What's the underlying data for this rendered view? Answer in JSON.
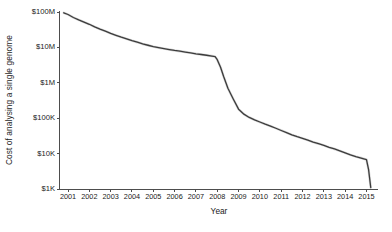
{
  "chart_data": {
    "type": "line",
    "title": "",
    "xlabel": "Year",
    "ylabel": "Cost of analysing a single genome",
    "yscale": "log",
    "ylim": [
      1000,
      100000000
    ],
    "xlim": [
      2000.6,
      2015.4
    ],
    "grid": false,
    "legend": null,
    "line_color": "#3c3c3c",
    "axis_color": "#4d4d4d",
    "ytick_labels": [
      "$100M",
      "$10M",
      "$1M",
      "$100K",
      "$10K",
      "$1K"
    ],
    "ytick_values": [
      100000000,
      10000000,
      1000000,
      100000,
      10000,
      1000
    ],
    "xtick_labels": [
      "2001",
      "2002",
      "2003",
      "2004",
      "2005",
      "2006",
      "2007",
      "2008",
      "2009",
      "2010",
      "2011",
      "2012",
      "2013",
      "2014",
      "2015"
    ],
    "xtick_values": [
      2001,
      2002,
      2003,
      2004,
      2005,
      2006,
      2007,
      2008,
      2009,
      2010,
      2011,
      2012,
      2013,
      2014,
      2015
    ],
    "series": [
      {
        "name": "Cost per genome",
        "x": [
          2000.8,
          2001.0,
          2001.25,
          2001.5,
          2001.75,
          2002.0,
          2002.25,
          2002.5,
          2002.75,
          2003.0,
          2003.25,
          2003.5,
          2003.75,
          2004.0,
          2004.25,
          2004.5,
          2004.75,
          2005.0,
          2005.25,
          2005.5,
          2005.75,
          2006.0,
          2006.25,
          2006.5,
          2006.75,
          2007.0,
          2007.25,
          2007.5,
          2007.75,
          2007.9,
          2008.0,
          2008.15,
          2008.3,
          2008.5,
          2008.75,
          2009.0,
          2009.25,
          2009.5,
          2009.75,
          2010.0,
          2010.25,
          2010.5,
          2010.75,
          2011.0,
          2011.25,
          2011.5,
          2011.75,
          2012.0,
          2012.25,
          2012.5,
          2012.75,
          2013.0,
          2013.25,
          2013.5,
          2013.75,
          2014.0,
          2014.25,
          2014.5,
          2014.75,
          2015.0,
          2015.1,
          2015.2
        ],
        "y": [
          95000000,
          85000000,
          70000000,
          60000000,
          52000000,
          45000000,
          38000000,
          33000000,
          29000000,
          25000000,
          22000000,
          19500000,
          17500000,
          15500000,
          14000000,
          12500000,
          11500000,
          10500000,
          9800000,
          9200000,
          8700000,
          8200000,
          7800000,
          7400000,
          7000000,
          6600000,
          6300000,
          6000000,
          5700000,
          5500000,
          4500000,
          2800000,
          1500000,
          700000,
          350000,
          180000,
          130000,
          105000,
          90000,
          78000,
          68000,
          60000,
          52000,
          45000,
          39000,
          34000,
          30000,
          27000,
          24000,
          21000,
          19000,
          17000,
          15000,
          13500,
          12000,
          10500,
          9200,
          8200,
          7500,
          6800,
          3500,
          1100
        ]
      }
    ]
  },
  "axes": {
    "x_title": "Year",
    "y_title": "Cost of analysing a single genome"
  }
}
